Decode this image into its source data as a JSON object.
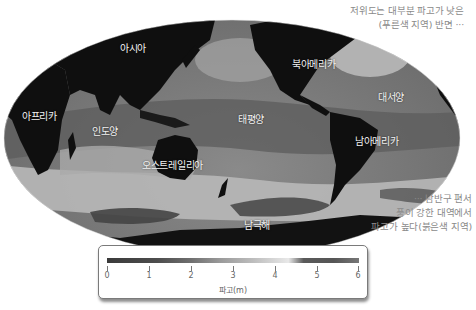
{
  "map": {
    "type": "world-map-significant-wave-height",
    "projection": "Mollweide-like (Pacific-centered)",
    "colors": {
      "land": "#0f0f0f",
      "ocean_low": "#555555",
      "ocean_high": "#d8d8d8",
      "background": "#ffffff"
    },
    "labels": {
      "asia": "아시아",
      "africa": "아프리카",
      "indian_ocean": "인도양",
      "australia": "오스트레일리아",
      "pacific": "태평양",
      "north_america": "북아메리카",
      "atlantic": "대서양",
      "south_america": "남아메리카",
      "southern_ocean": "남극해"
    }
  },
  "annotations": {
    "top_right": [
      "저위도는 대부분 파고가 낮은",
      "(푸른색 지역) 반면 ···"
    ],
    "bottom_right": [
      "··· 남반구 편서",
      "풍이 강한 대역에서",
      "파고가 높다(붉은색 지역)"
    ]
  },
  "legend": {
    "title": "파고(m)",
    "ticks": [
      "0",
      "1",
      "2",
      "3",
      "4",
      "5",
      "6"
    ],
    "min": 0,
    "max": 6
  }
}
